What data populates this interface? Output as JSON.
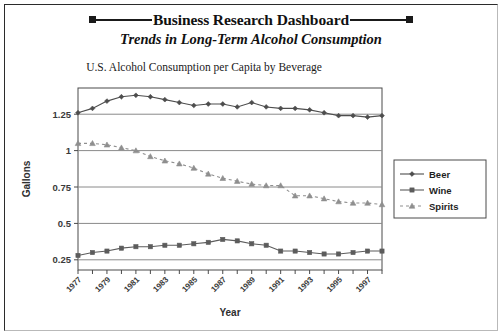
{
  "header": {
    "title": "Business Research Dashboard",
    "subtitle": "Trends in Long-Term Alcohol Consumption",
    "left_marker": "square-marker",
    "right_marker": "square-marker"
  },
  "chart_data": {
    "type": "line",
    "title": "U.S. Alcohol Consumption per Capita by Beverage",
    "xlabel": "Year",
    "ylabel": "Gallons",
    "grid": true,
    "legend_position": "right",
    "xlim": [
      1977,
      1998
    ],
    "ylim": [
      0.18,
      1.43
    ],
    "yticks": [
      "0.25",
      "0.5",
      "0.75",
      "1",
      "1.25"
    ],
    "ytick_values": [
      0.25,
      0.5,
      0.75,
      1,
      1.25
    ],
    "x": [
      1977,
      1978,
      1979,
      1980,
      1981,
      1982,
      1983,
      1984,
      1985,
      1986,
      1987,
      1988,
      1989,
      1990,
      1991,
      1992,
      1993,
      1994,
      1995,
      1996,
      1997,
      1998
    ],
    "xtick_labels": [
      "1977",
      "1979",
      "1981",
      "1983",
      "1985",
      "1987",
      "1989",
      "1991",
      "1993",
      "1995",
      "1997"
    ],
    "series": [
      {
        "name": "Beer",
        "color": "#4d4d4d",
        "marker": "diamond",
        "dash": "solid",
        "values": [
          1.26,
          1.29,
          1.34,
          1.37,
          1.38,
          1.37,
          1.35,
          1.33,
          1.31,
          1.32,
          1.32,
          1.3,
          1.33,
          1.3,
          1.29,
          1.29,
          1.28,
          1.26,
          1.24,
          1.24,
          1.23,
          1.24
        ]
      },
      {
        "name": "Wine",
        "color": "#5c5c5c",
        "marker": "square",
        "dash": "solid",
        "values": [
          0.28,
          0.3,
          0.31,
          0.33,
          0.34,
          0.34,
          0.35,
          0.35,
          0.36,
          0.37,
          0.39,
          0.38,
          0.36,
          0.35,
          0.31,
          0.31,
          0.3,
          0.29,
          0.29,
          0.3,
          0.31,
          0.31
        ]
      },
      {
        "name": "Spirits",
        "color": "#8f8f8f",
        "marker": "triangle",
        "dash": "dashed",
        "values": [
          1.05,
          1.05,
          1.04,
          1.02,
          1.0,
          0.96,
          0.93,
          0.91,
          0.88,
          0.84,
          0.81,
          0.79,
          0.77,
          0.76,
          0.76,
          0.69,
          0.69,
          0.67,
          0.65,
          0.64,
          0.64,
          0.63
        ]
      }
    ]
  }
}
